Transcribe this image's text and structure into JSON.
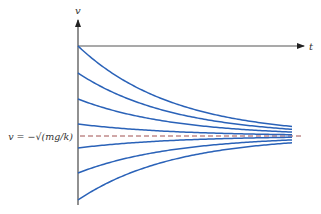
{
  "diagram": {
    "type": "slope-field-solution-curves",
    "axes": {
      "vertical_label": "v",
      "horizontal_label": "t"
    },
    "equilibrium": {
      "label": "v = −√(mg/k)",
      "line_style": "dashed",
      "line_color": "#b04040"
    },
    "curve_color": "#2a62b8",
    "axis_color": "#333333",
    "curves": [
      {
        "start_offset": -90
      },
      {
        "start_offset": -63
      },
      {
        "start_offset": -37
      },
      {
        "start_offset": -12
      },
      {
        "start_offset": 12
      },
      {
        "start_offset": 37
      },
      {
        "start_offset": 64
      }
    ]
  }
}
